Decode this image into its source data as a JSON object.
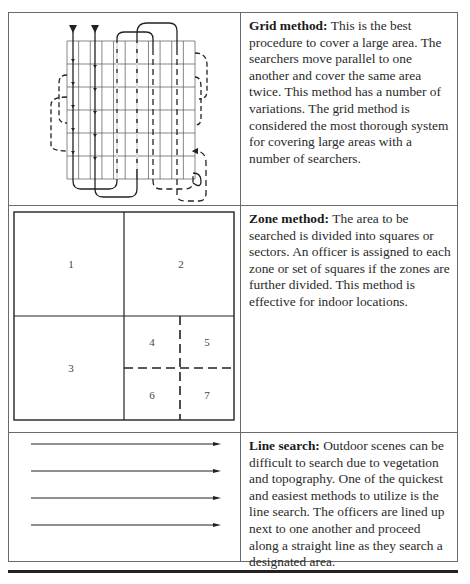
{
  "methods": [
    {
      "id": "grid",
      "title": "Grid method:",
      "description": "This is the best procedure to cover a large area. The searchers move parallel to one another and cover the same area twice. This method has a number of variations. The grid method is considered the most thorough system for covering large areas with a number of searchers.",
      "figure": "grid-search-diagram"
    },
    {
      "id": "zone",
      "title": "Zone method:",
      "description": "The area to be searched is divided into squares or sectors. An officer is assigned to each zone or set of squares if the zones are further divided. This method is effective for indoor locations.",
      "figure": "zone-search-diagram",
      "zone_labels": [
        "1",
        "2",
        "3",
        "4",
        "5",
        "6",
        "7"
      ]
    },
    {
      "id": "line",
      "title": "Line search:",
      "description": "Outdoor scenes can be difficult to search due to vegetation and topography. One of the quickest and easiest methods to utilize is the line search. The officers are lined up next to one another and proceed along a straight line as they search a designated area.",
      "figure": "line-search-diagram",
      "arrow_count": 4
    }
  ]
}
